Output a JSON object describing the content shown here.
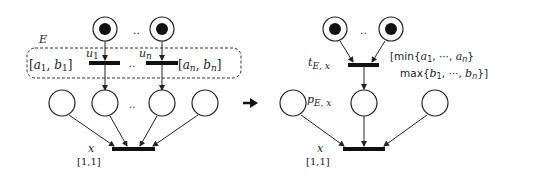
{
  "diagram": {
    "type": "petri-net-transformation",
    "colors": {
      "stroke": "#222222",
      "token": "#111111",
      "background": "#ffffff"
    },
    "left": {
      "group_label": "E",
      "ellipsis": "..",
      "transitions": [
        {
          "name": "u",
          "sub": "1",
          "interval": "[a1, b1]",
          "interval_open": "[",
          "a": "a",
          "a_sub": "1",
          "b": "b",
          "b_sub": "1",
          "interval_close": "]"
        },
        {
          "name": "u",
          "sub": "n",
          "interval": "[an, bn]",
          "interval_open": "[",
          "a": "a",
          "a_sub": "n",
          "b": "b",
          "b_sub": "n",
          "interval_close": "]"
        }
      ],
      "sink_transition": {
        "name": "x",
        "interval": "[1,1]"
      }
    },
    "arrow": "rewrites-to",
    "right": {
      "ellipsis": "..",
      "merged_transition": {
        "name": "t",
        "sub": "E, x",
        "interval_line1": "[min{a1, ···, an}",
        "interval_line2": "max{b1, ···, bn}]",
        "min_label": "[min{",
        "max_label": "max{",
        "a": "a",
        "a1": "1",
        "an": "n",
        "b": "b",
        "b1": "1",
        "bn": "n",
        "dots": "···"
      },
      "merged_place": {
        "name": "p",
        "sub": "E, x"
      },
      "sink_transition": {
        "name": "x",
        "interval": "[1,1]"
      }
    }
  }
}
